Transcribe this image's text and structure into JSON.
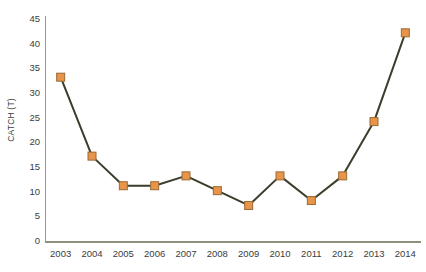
{
  "chart_data": {
    "type": "line",
    "title": "",
    "xlabel": "",
    "ylabel": "CATCH (T)",
    "categories": [
      "2003",
      "2004",
      "2005",
      "2006",
      "2007",
      "2008",
      "2009",
      "2010",
      "2011",
      "2012",
      "2013",
      "2014"
    ],
    "values": [
      33,
      17,
      11,
      11,
      13,
      10,
      7,
      13,
      8,
      13,
      24,
      42
    ],
    "series": [
      {
        "name": "CATCH (T)",
        "values": [
          33,
          17,
          11,
          11,
          13,
          10,
          7,
          13,
          8,
          13,
          24,
          42
        ]
      }
    ],
    "ylim": [
      0,
      45
    ],
    "y_ticks": [
      0,
      5,
      10,
      15,
      20,
      25,
      30,
      35,
      40,
      45
    ],
    "grid": false,
    "legend": false,
    "legend_position": "none",
    "marker": "square",
    "colors": {
      "line": "#3a3e2a",
      "marker_fill": "#e8944a",
      "marker_border": "#9a6a35",
      "axis": "#8f8f7b",
      "text": "#3c3c3c",
      "background": "#ffffff"
    }
  }
}
